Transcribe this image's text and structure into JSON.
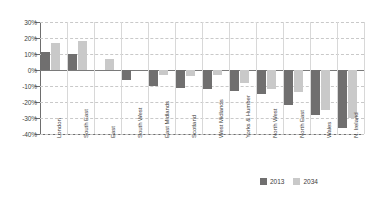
{
  "chart_data": {
    "type": "bar",
    "title": "",
    "subtitle": "",
    "xlabel": "",
    "ylabel": "",
    "categories": [
      "London",
      "South East",
      "East",
      "South West",
      "East Midlands",
      "Scotland",
      "West Midlands",
      "Yorks & Humber",
      "North West",
      "North East",
      "Wales",
      "N. Ireland"
    ],
    "series": [
      {
        "name": "2013",
        "color": "#706f6f",
        "values": [
          11,
          10,
          0,
          -6,
          -10,
          -11,
          -12,
          -13,
          -15,
          -22,
          -28,
          -36
        ]
      },
      {
        "name": "2034",
        "color": "#c9c9c9",
        "values": [
          17,
          18,
          7,
          0,
          -3,
          -4,
          -3,
          -8,
          -12,
          -14,
          -25,
          -30
        ]
      }
    ],
    "ylim": [
      -40,
      30
    ],
    "ytick_values": [
      30,
      20,
      10,
      0,
      -10,
      -20,
      -30,
      -40
    ],
    "ytick_labels": [
      "30%",
      "20%",
      "10%",
      "0%",
      "-10%",
      "-20%",
      "-30%",
      "-40%"
    ],
    "grid": "horizontal-dashed-vertical-solid",
    "legend_position": "bottom-right",
    "value_suffix": "%"
  },
  "legend": {
    "entries": [
      {
        "label": "2013",
        "color": "#706f6f"
      },
      {
        "label": "2034",
        "color": "#c9c9c9"
      }
    ]
  },
  "colors": {
    "series_2013": "#706f6f",
    "series_2034": "#c9c9c9",
    "axis": "#6e6e6e",
    "gridline": "#c9c9c9",
    "background": "#ffffff",
    "text": "#3d3d3d"
  }
}
